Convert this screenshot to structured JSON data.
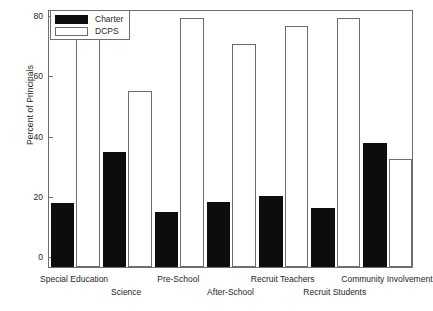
{
  "chart_data": {
    "type": "bar",
    "title": "",
    "xlabel": "",
    "ylabel": "Percent of Principals",
    "ylim": [
      0,
      85
    ],
    "yticks": [
      0,
      20,
      40,
      60,
      80
    ],
    "grid": false,
    "legend_position": "top-left",
    "categories": [
      "Special Education",
      "Science",
      "Pre-School",
      "After-School",
      "Recruit Teachers",
      "Recruit Students",
      "Community Involvement"
    ],
    "series": [
      {
        "name": "Charter",
        "color": "#0d0d0d",
        "values": [
          21,
          38,
          18,
          21.5,
          23.5,
          19.5,
          41
        ]
      },
      {
        "name": "DCPS",
        "color": "#ffffff",
        "values": [
          82,
          58,
          82,
          73.5,
          79.5,
          82,
          35.5
        ]
      }
    ]
  },
  "legend": {
    "entries": [
      {
        "label": "Charter",
        "swatch": "charter"
      },
      {
        "label": "DCPS",
        "swatch": "dcps"
      }
    ]
  },
  "axis": {
    "y_title": "Percent of Principals",
    "y_tick_labels": [
      "0",
      "20",
      "40",
      "60",
      "80"
    ]
  }
}
